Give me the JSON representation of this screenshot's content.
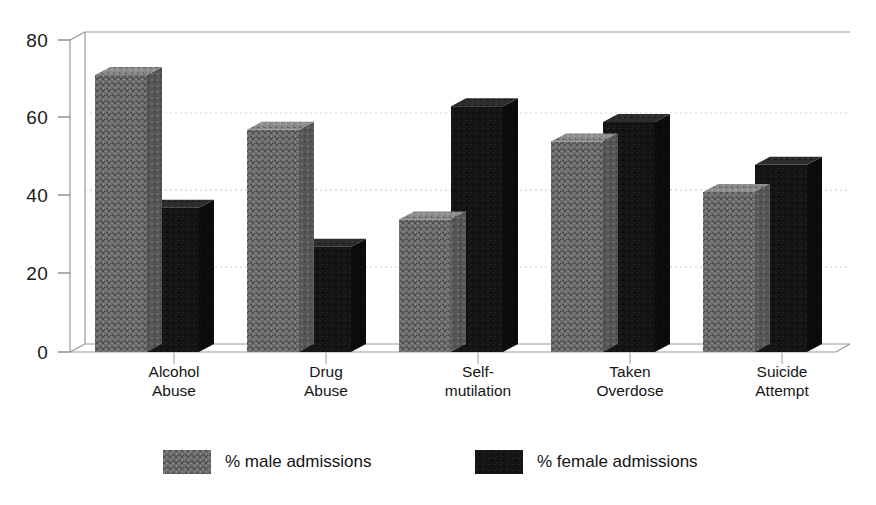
{
  "chart_data": {
    "type": "bar",
    "title": "",
    "subtitle": "",
    "xlabel": "",
    "ylabel": "",
    "categories": [
      "Alcohol Abuse",
      "Drug Abuse",
      "Self-mutilation",
      "Taken Overdose",
      "Suicide Attempt"
    ],
    "category_lines": [
      [
        "Alcohol",
        "Abuse"
      ],
      [
        "Drug",
        "Abuse"
      ],
      [
        "Self-",
        "mutilation"
      ],
      [
        "Taken",
        "Overdose"
      ],
      [
        "Suicide",
        "Attempt"
      ]
    ],
    "series": [
      {
        "name": "% male admissions",
        "values": [
          71,
          57,
          34,
          54,
          41
        ],
        "color": "#6d6d6d"
      },
      {
        "name": "% female admissions",
        "values": [
          37,
          27,
          63,
          59,
          48
        ],
        "color": "#141414"
      }
    ],
    "ylim": [
      0,
      80
    ],
    "yticks": [
      0,
      20,
      40,
      60,
      80
    ],
    "ytick_labels": [
      "0",
      "20",
      "40",
      "60",
      "80"
    ],
    "grid": true,
    "grid_style": "dotted-horizontal",
    "three_d": true,
    "legend_position": "bottom"
  },
  "axes": {
    "y_tick_labels": [
      "80",
      "60",
      "40",
      "20",
      "0"
    ]
  },
  "legend": {
    "items": [
      {
        "label": "% male admissions",
        "swatch_name": "legend-swatch-male"
      },
      {
        "label": "% female admissions",
        "swatch_name": "legend-swatch-female"
      }
    ]
  },
  "colors": {
    "male_front": "#6d6d6d",
    "male_top": "#8a8a8a",
    "male_side": "#565656",
    "female_front": "#141414",
    "female_top": "#2e2e2e",
    "female_side": "#0a0a0a",
    "frame": "#9a9a9a",
    "grid": "#c9c9c9",
    "background": "#ffffff",
    "text": "#111111"
  }
}
